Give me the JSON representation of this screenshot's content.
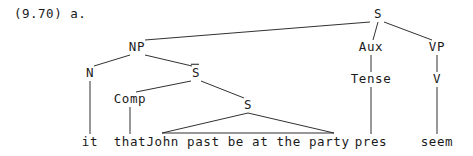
{
  "figure": {
    "example_label": "(9.70) a.",
    "ink_color": "#1a1a1a",
    "background_color": "#ffffff"
  },
  "tree": {
    "nodes": {
      "root_s": {
        "label": "S",
        "x": 378,
        "y": 14
      },
      "np": {
        "label": "NP",
        "x": 137,
        "y": 47
      },
      "aux": {
        "label": "Aux",
        "x": 371,
        "y": 47
      },
      "vp": {
        "label": "VP",
        "x": 437,
        "y": 47
      },
      "n": {
        "label": "N",
        "x": 90,
        "y": 73
      },
      "s_bar": {
        "label": "S",
        "x": 196,
        "y": 73
      },
      "tense": {
        "label": "Tense",
        "x": 371,
        "y": 79
      },
      "v": {
        "label": "V",
        "x": 437,
        "y": 79
      },
      "comp": {
        "label": "Comp",
        "x": 130,
        "y": 99
      },
      "embedded_s": {
        "label": "S",
        "x": 248,
        "y": 105
      }
    },
    "leaves": {
      "it": {
        "label": "it",
        "x": 90,
        "y": 142
      },
      "that": {
        "label": "that",
        "x": 130,
        "y": 142
      },
      "embedded_clause": {
        "label": "John past be at the party",
        "x": 248,
        "y": 142
      },
      "pres": {
        "label": "pres",
        "x": 371,
        "y": 142
      },
      "seem": {
        "label": "seem",
        "x": 437,
        "y": 142
      }
    },
    "edges": [
      {
        "name": "edge-root-s-to-np",
        "x1": 370,
        "y1": 22,
        "x2": 145,
        "y2": 40
      },
      {
        "name": "edge-root-s-to-aux",
        "x1": 378,
        "y1": 22,
        "x2": 373,
        "y2": 40
      },
      {
        "name": "edge-root-s-to-vp",
        "x1": 384,
        "y1": 22,
        "x2": 432,
        "y2": 40
      },
      {
        "name": "edge-np-to-n",
        "x1": 130,
        "y1": 55,
        "x2": 94,
        "y2": 66
      },
      {
        "name": "edge-np-to-s-bar",
        "x1": 145,
        "y1": 55,
        "x2": 192,
        "y2": 66
      },
      {
        "name": "edge-n-to-it",
        "x1": 90,
        "y1": 81,
        "x2": 90,
        "y2": 134
      },
      {
        "name": "edge-s-bar-to-comp",
        "x1": 191,
        "y1": 81,
        "x2": 136,
        "y2": 92
      },
      {
        "name": "edge-s-bar-to-embedded-s",
        "x1": 201,
        "y1": 81,
        "x2": 244,
        "y2": 98
      },
      {
        "name": "edge-comp-to-that",
        "x1": 130,
        "y1": 107,
        "x2": 130,
        "y2": 134
      },
      {
        "name": "edge-aux-to-tense",
        "x1": 371,
        "y1": 55,
        "x2": 371,
        "y2": 72
      },
      {
        "name": "edge-tense-to-pres",
        "x1": 371,
        "y1": 87,
        "x2": 371,
        "y2": 134
      },
      {
        "name": "edge-vp-to-v",
        "x1": 437,
        "y1": 55,
        "x2": 437,
        "y2": 72
      },
      {
        "name": "edge-v-to-seem",
        "x1": 437,
        "y1": 87,
        "x2": 437,
        "y2": 134
      }
    ],
    "triangle": {
      "name": "embedded-clause-triangle",
      "apex_x": 248,
      "apex_y": 113,
      "left_x": 162,
      "right_x": 334,
      "base_y": 133
    }
  }
}
